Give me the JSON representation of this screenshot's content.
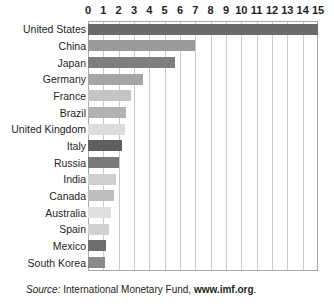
{
  "chart_data": {
    "type": "bar",
    "orientation": "horizontal",
    "title": "",
    "subtitle": "",
    "xlabel": "",
    "ylabel": "",
    "xlim": [
      0,
      15
    ],
    "grid": true,
    "legend": "none",
    "tick_labels": [
      "0",
      "1",
      "2",
      "3",
      "4",
      "5",
      "6",
      "7",
      "8",
      "9",
      "10",
      "11",
      "12",
      "13",
      "14",
      "15"
    ],
    "tick_values": [
      0,
      1,
      2,
      3,
      4,
      5,
      6,
      7,
      8,
      9,
      10,
      11,
      12,
      13,
      14,
      15
    ],
    "categories": [
      "United States",
      "China",
      "Japan",
      "Germany",
      "France",
      "Brazil",
      "United Kingdom",
      "Italy",
      "Russia",
      "India",
      "Canada",
      "Australia",
      "Spain",
      "Mexico",
      "South Korea"
    ],
    "values": [
      15.0,
      7.0,
      5.7,
      3.6,
      2.8,
      2.5,
      2.4,
      2.2,
      2.0,
      1.8,
      1.7,
      1.5,
      1.4,
      1.2,
      1.1
    ],
    "bar_colors": [
      "#6b6b6b",
      "#9a9a9a",
      "#7e7e7e",
      "#a6a6a6",
      "#c4c4c4",
      "#b2b2b2",
      "#dcdcdc",
      "#5f5f5f",
      "#7a7a7a",
      "#cfcfcf",
      "#bdbdbd",
      "#e0e0e0",
      "#d2d2d2",
      "#6e6e6e",
      "#8a8a8a"
    ],
    "bars": [
      {
        "category": "United States",
        "value": 15.0,
        "color": "#6b6b6b"
      },
      {
        "category": "China",
        "value": 7.0,
        "color": "#9a9a9a"
      },
      {
        "category": "Japan",
        "value": 5.7,
        "color": "#7e7e7e"
      },
      {
        "category": "Germany",
        "value": 3.6,
        "color": "#a6a6a6"
      },
      {
        "category": "France",
        "value": 2.8,
        "color": "#c4c4c4"
      },
      {
        "category": "Brazil",
        "value": 2.5,
        "color": "#b2b2b2"
      },
      {
        "category": "United Kingdom",
        "value": 2.4,
        "color": "#dcdcdc"
      },
      {
        "category": "Italy",
        "value": 2.2,
        "color": "#5f5f5f"
      },
      {
        "category": "Russia",
        "value": 2.0,
        "color": "#7a7a7a"
      },
      {
        "category": "India",
        "value": 1.8,
        "color": "#cfcfcf"
      },
      {
        "category": "Canada",
        "value": 1.7,
        "color": "#bdbdbd"
      },
      {
        "category": "Australia",
        "value": 1.5,
        "color": "#e0e0e0"
      },
      {
        "category": "Spain",
        "value": 1.4,
        "color": "#d2d2d2"
      },
      {
        "category": "Mexico",
        "value": 1.2,
        "color": "#6e6e6e"
      },
      {
        "category": "South Korea",
        "value": 1.1,
        "color": "#8a8a8a"
      }
    ]
  },
  "source": {
    "label": "Source:",
    "organization": "International Monetary Fund,",
    "url": "www.imf.org",
    "period": "."
  },
  "colors": {
    "text": "#231f20",
    "gridline": "#c9c9c9",
    "axis_border": "#a8a8a8",
    "background": "#ffffff"
  }
}
